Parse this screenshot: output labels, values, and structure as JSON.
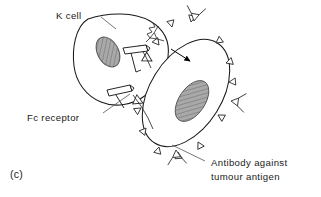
{
  "figure": {
    "panel_label": "(c)",
    "background_color": "#ffffff",
    "line_color": "#1a1a1a",
    "nucleus_fill_color": "#a8a8a8",
    "nucleus_hatch_color": "#6b6b6b",
    "cell_fill_color": "#ffffff",
    "arrow_color": "#000000"
  },
  "labels": {
    "k_cell": "K cell",
    "fc_receptor": "Fc receptor",
    "antibody_line1": "Antibody against",
    "antibody_line2": "tumour antigen"
  },
  "structures": {
    "k_cell": {
      "name": "K cell",
      "nucleus": "hatched-ellipse",
      "fc_receptor_count": 2
    },
    "tumour_cell": {
      "name": "Tumour cell",
      "nucleus": "hatched-ellipse",
      "surface_antibody_count": 11
    },
    "free_antibodies": {
      "name": "Y-shaped antibody",
      "count": 4
    },
    "killing_arrow": {
      "name": "cytotoxic-attack-arrow",
      "style": "filled-triangle-arrowhead"
    }
  }
}
